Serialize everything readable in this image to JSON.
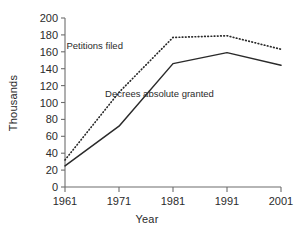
{
  "chart_data": {
    "type": "line",
    "title": "",
    "xlabel": "Year",
    "ylabel": "Thousands",
    "x": [
      1961,
      1971,
      1981,
      1991,
      2001
    ],
    "xticklabels": [
      "1961",
      "1971",
      "1981",
      "1991",
      "2001"
    ],
    "yticks": [
      0,
      20,
      40,
      60,
      80,
      100,
      120,
      140,
      160,
      180,
      200
    ],
    "yticklabels": [
      "0",
      "20",
      "40",
      "60",
      "80",
      "100",
      "120",
      "140",
      "160",
      "180",
      "200"
    ],
    "xlim": [
      1961,
      2001
    ],
    "ylim": [
      0,
      200
    ],
    "grid": false,
    "legend": "inline-annotations",
    "series": [
      {
        "name": "Petitions filed",
        "style": "dotted",
        "color": "#2a2a2a",
        "values": [
          32,
          112,
          177,
          179,
          163
        ]
      },
      {
        "name": "Decrees absolute granted",
        "style": "solid",
        "color": "#2a2a2a",
        "values": [
          25,
          72,
          146,
          159,
          144
        ]
      }
    ],
    "annotations": [
      {
        "text": "Petitions filed",
        "x": 1966.5,
        "y": 163
      },
      {
        "text": "Decrees absolute granted",
        "x": 1978.5,
        "y": 107
      }
    ]
  },
  "axes": {
    "ylabel": "Thousands",
    "xlabel": "Year"
  }
}
